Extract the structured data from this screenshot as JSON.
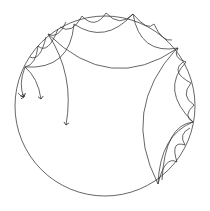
{
  "diagram": {
    "type": "poincare-disk-hyperbolic-tiling",
    "stroke_color": "#333333",
    "background": "#ffffff",
    "disk": {
      "cx": 105,
      "cy": 106,
      "r": 90
    },
    "arrows": 3
  }
}
